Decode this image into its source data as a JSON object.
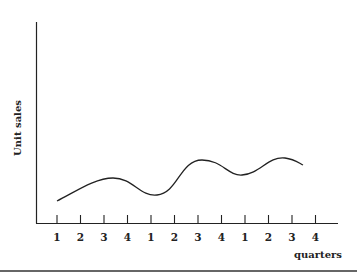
{
  "chart_data": {
    "type": "line",
    "title": "",
    "xlabel": "quarters",
    "ylabel": "Unit sales",
    "categories": [
      "1",
      "2",
      "3",
      "4",
      "1",
      "2",
      "3",
      "4",
      "1",
      "2",
      "3",
      "4"
    ],
    "series": [
      {
        "name": "Unit sales",
        "values": [
          20,
          28,
          36,
          39,
          33,
          25,
          52,
          58,
          47,
          45,
          54,
          55
        ],
        "note": "Qualitative curve with no y-axis scale; values are relative heights estimated from the plot"
      }
    ],
    "grid": false,
    "legend": null,
    "y_ticks": "none",
    "x_tick_positions": [
      57,
      80.5,
      104,
      127.5,
      151,
      174.5,
      198,
      221.5,
      245,
      268.5,
      292,
      315.5
    ]
  },
  "axes": {
    "x_label": "quarters",
    "y_label": "Unit sales"
  },
  "colors": {
    "line": "#222222",
    "axis": "#222222",
    "background": "#ffffff"
  }
}
